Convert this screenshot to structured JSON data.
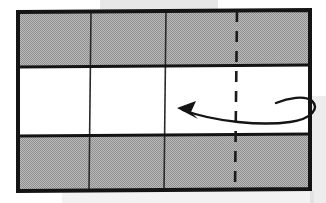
{
  "figure": {
    "background_color": "#ffffff"
  },
  "sheet": {
    "name": "paper-sheet",
    "outline_color": "#141414",
    "outline_width": 4,
    "left": 18,
    "right": 310,
    "top_left_y": 12,
    "top_right_y": 10,
    "bottom_left_y": 191,
    "bottom_right_y": 189
  },
  "bands": [
    {
      "name": "top-shaded-band",
      "fill": "#a9a9a9",
      "shaded": true,
      "y_left_top": 12,
      "y_left_bottom": 67,
      "y_right_top": 10,
      "y_right_bottom": 65
    },
    {
      "name": "middle-white-band",
      "fill": "#ffffff",
      "shaded": false,
      "y_left_top": 67,
      "y_left_bottom": 136,
      "y_right_top": 65,
      "y_right_bottom": 134
    },
    {
      "name": "bottom-shaded-band",
      "fill": "#a9a9a9",
      "shaded": true,
      "y_left_top": 136,
      "y_left_bottom": 191,
      "y_right_top": 134,
      "y_right_bottom": 189
    }
  ],
  "crease_lines": {
    "horizontal": [
      {
        "name": "crease-horizontal-upper",
        "x1": 18,
        "y1": 67,
        "x2": 310,
        "y2": 65,
        "style": "solid",
        "width": 3.2
      },
      {
        "name": "crease-horizontal-lower",
        "x1": 18,
        "y1": 136,
        "x2": 310,
        "y2": 134,
        "style": "solid",
        "width": 3.2
      }
    ],
    "vertical": [
      {
        "name": "crease-vertical-left",
        "x1": 91,
        "y1": 12,
        "x2": 89,
        "y2": 191,
        "style": "solid",
        "width": 1.6
      },
      {
        "name": "crease-vertical-middle",
        "x1": 166,
        "y1": 11,
        "x2": 164,
        "y2": 190,
        "style": "solid",
        "width": 1.6
      }
    ],
    "dashed": [
      {
        "name": "fold-line-dashed",
        "x1": 237,
        "y1": 11,
        "x2": 235,
        "y2": 190,
        "style": "dashed",
        "width": 2.6,
        "dash_pattern": "11 9"
      }
    ]
  },
  "arrow": {
    "name": "fold-behind-arrow",
    "type": "wrap-around-curved-arrow",
    "direction": "leftward",
    "stroke_color": "#141414",
    "stroke_width": 2.4,
    "head_tip_x": 177,
    "head_tip_y": 108,
    "path": "M 183 110 C 215 122, 262 126, 290 122 C 312 119, 320 108, 312 101 C 305 95, 288 98, 276 103",
    "head_points": "177,108 196,101 191,112 198,119"
  },
  "scan_artifacts": [
    {
      "name": "scan-shadow-top",
      "x": 100,
      "y": 0,
      "width": 118,
      "height": 11,
      "color": "rgba(120,120,120,0.18)"
    },
    {
      "name": "scan-shadow-right",
      "x": 310,
      "y": 96,
      "width": 16,
      "height": 107,
      "color": "rgba(140,140,140,0.16)"
    },
    {
      "name": "scan-shadow-bottom",
      "x": 62,
      "y": 191,
      "width": 252,
      "height": 12,
      "color": "rgba(150,150,150,0.12)"
    }
  ]
}
